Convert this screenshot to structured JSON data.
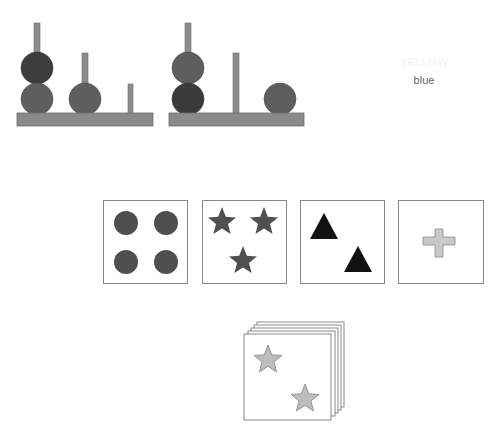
{
  "colors": {
    "peg_fill": "#8c8c8c",
    "peg_stroke": "#6e6e6e",
    "base_fill": "#8a8a8a",
    "disk_dark": "#3b3b3b",
    "disk_mid": "#5e5e5e",
    "card_border": "#888888",
    "dot_fill": "#4f4f4f",
    "star_fill": "#505050",
    "triangle_fill": "#111111",
    "cross_fill": "#c9c9c9",
    "deck_star_fill": "#bdbdbd"
  },
  "tower_puzzles": [
    {
      "name": "tower-left",
      "pegs": [
        {
          "disks": [
            "dark",
            "mid"
          ]
        },
        {
          "disks": [
            "mid"
          ]
        },
        {
          "disks": []
        }
      ]
    },
    {
      "name": "tower-right",
      "pegs": [
        {
          "disks": [
            "mid",
            "dark"
          ]
        },
        {
          "disks": []
        },
        {
          "disks": [
            "mid"
          ]
        }
      ]
    }
  ],
  "stroop": {
    "word_top": "YELLOW",
    "word_bottom": "blue"
  },
  "sort_cards": [
    {
      "shape": "circle",
      "count": 4,
      "color": "dark-gray"
    },
    {
      "shape": "star",
      "count": 3,
      "color": "dark-gray"
    },
    {
      "shape": "triangle",
      "count": 2,
      "color": "black"
    },
    {
      "shape": "cross",
      "count": 1,
      "color": "light-gray"
    }
  ],
  "deck_card": {
    "shape": "star",
    "count": 2,
    "color": "light-gray"
  }
}
